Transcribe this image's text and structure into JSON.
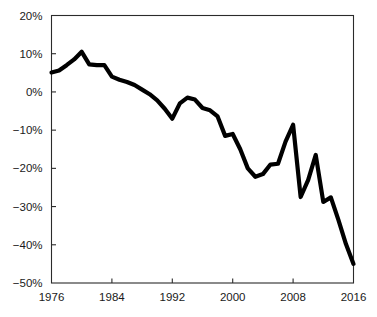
{
  "chart_data": {
    "type": "line",
    "title": "",
    "subtitle": "",
    "xlabel": "",
    "ylabel": "",
    "xlim": [
      1976,
      2016
    ],
    "ylim": [
      -50,
      20
    ],
    "grid": false,
    "legend": null,
    "line_color": "#000000",
    "line_width": 4.2,
    "axis_color": "#2b2b2b",
    "background_color": "#ffffff",
    "xticks": [
      1976,
      1984,
      1992,
      2000,
      2008,
      2016
    ],
    "xticklabels": [
      "1976",
      "1984",
      "1992",
      "2000",
      "2008",
      "2016"
    ],
    "yticks": [
      20,
      10,
      0,
      -10,
      -20,
      -30,
      -40,
      -50
    ],
    "yticklabels": [
      "20%",
      "10%",
      "0%",
      "−10%",
      "−20%",
      "−30%",
      "−40%",
      "−50%"
    ],
    "x": [
      1976,
      1977,
      1978,
      1979,
      1980,
      1981,
      1982,
      1983,
      1984,
      1985,
      1986,
      1987,
      1988,
      1989,
      1990,
      1991,
      1992,
      1993,
      1994,
      1995,
      1996,
      1997,
      1998,
      1999,
      2000,
      2001,
      2002,
      2003,
      2004,
      2005,
      2006,
      2007,
      2008,
      2009,
      2010,
      2011,
      2012,
      2013,
      2014,
      2015,
      2016
    ],
    "values": [
      5.1,
      5.6,
      7.0,
      8.5,
      10.5,
      7.2,
      7.0,
      7.0,
      4.0,
      3.2,
      2.6,
      1.8,
      0.6,
      -0.6,
      -2.2,
      -4.4,
      -7.0,
      -3.0,
      -1.5,
      -2.0,
      -4.2,
      -4.8,
      -6.4,
      -11.5,
      -11.0,
      -15.0,
      -20.0,
      -22.2,
      -21.5,
      -19.0,
      -18.8,
      -13.0,
      -8.6,
      -27.5,
      -23.0,
      -16.5,
      -28.8,
      -27.6,
      -33.5,
      -39.8,
      -45.0
    ],
    "series": [
      {
        "name": "series-1",
        "values": [
          5.1,
          5.6,
          7.0,
          8.5,
          10.5,
          7.2,
          7.0,
          7.0,
          4.0,
          3.2,
          2.6,
          1.8,
          0.6,
          -0.6,
          -2.2,
          -4.4,
          -7.0,
          -3.0,
          -1.5,
          -2.0,
          -4.2,
          -4.8,
          -6.4,
          -11.5,
          -11.0,
          -15.0,
          -20.0,
          -22.2,
          -21.5,
          -19.0,
          -18.8,
          -13.0,
          -8.6,
          -27.5,
          -23.0,
          -16.5,
          -28.8,
          -27.6,
          -33.5,
          -39.8,
          -45.0
        ]
      }
    ],
    "annotations": []
  }
}
